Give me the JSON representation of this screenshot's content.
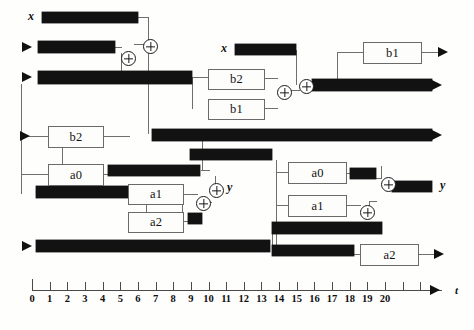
{
  "diagram": {
    "signal_labels": {
      "x_top_left": "x",
      "x_mid_top": "x",
      "y_mid_left": "y",
      "y_right": "y"
    },
    "operator_boxes": [
      {
        "id": "b2-left",
        "label": "b2",
        "x": 48,
        "y": 126,
        "w": 54,
        "h": 20
      },
      {
        "id": "a0-left",
        "label": "a0",
        "x": 48,
        "y": 164,
        "w": 54,
        "h": 20
      },
      {
        "id": "a1-mid",
        "label": "a1",
        "x": 128,
        "y": 184,
        "w": 54,
        "h": 19
      },
      {
        "id": "a2-mid",
        "label": "a2",
        "x": 128,
        "y": 212,
        "w": 54,
        "h": 19
      },
      {
        "id": "b2-mid",
        "label": "b2",
        "x": 208,
        "y": 69,
        "w": 55,
        "h": 19
      },
      {
        "id": "b1-mid",
        "label": "b1",
        "x": 208,
        "y": 99,
        "w": 55,
        "h": 19
      },
      {
        "id": "b1-top-right",
        "label": "b1",
        "x": 363,
        "y": 42,
        "w": 57,
        "h": 20
      },
      {
        "id": "a0-right",
        "label": "a0",
        "x": 288,
        "y": 162,
        "w": 57,
        "h": 20
      },
      {
        "id": "a1-right",
        "label": "a1",
        "x": 288,
        "y": 195,
        "w": 57,
        "h": 20
      },
      {
        "id": "a2-right",
        "label": "a2",
        "x": 360,
        "y": 244,
        "w": 57,
        "h": 20
      }
    ],
    "adders": [
      {
        "id": "add-1",
        "x": 121,
        "y": 51
      },
      {
        "id": "add-2",
        "x": 143,
        "y": 39
      },
      {
        "id": "add-3",
        "x": 277,
        "y": 85
      },
      {
        "id": "add-4",
        "x": 299,
        "y": 79
      },
      {
        "id": "add-5",
        "x": 209,
        "y": 183
      },
      {
        "id": "add-6",
        "x": 196,
        "y": 196
      },
      {
        "id": "add-7",
        "x": 381,
        "y": 177
      },
      {
        "id": "add-8",
        "x": 360,
        "y": 205
      }
    ],
    "bars": [
      {
        "id": "bar-x-top",
        "x": 42,
        "y": 12,
        "w": 96,
        "h": 11
      },
      {
        "id": "bar-row2",
        "x": 38,
        "y": 41,
        "w": 77,
        "h": 12
      },
      {
        "id": "bar-row3",
        "x": 38,
        "y": 71,
        "w": 154,
        "h": 13
      },
      {
        "id": "bar-x-mid",
        "x": 235,
        "y": 44,
        "w": 61,
        "h": 11
      },
      {
        "id": "bar-out-upper",
        "x": 312,
        "y": 79,
        "w": 120,
        "h": 12
      },
      {
        "id": "bar-long-mid",
        "x": 152,
        "y": 129,
        "w": 280,
        "h": 12
      },
      {
        "id": "bar-short-mid",
        "x": 190,
        "y": 149,
        "w": 82,
        "h": 11
      },
      {
        "id": "bar-a0-out-left",
        "x": 108,
        "y": 165,
        "w": 92,
        "h": 11
      },
      {
        "id": "bar-left-mid",
        "x": 36,
        "y": 186,
        "w": 110,
        "h": 12
      },
      {
        "id": "bar-a0-out-right",
        "x": 350,
        "y": 168,
        "w": 26,
        "h": 11
      },
      {
        "id": "bar-y-right",
        "x": 392,
        "y": 181,
        "w": 40,
        "h": 11
      },
      {
        "id": "bar-a2-feed",
        "x": 188,
        "y": 213,
        "w": 14,
        "h": 11
      },
      {
        "id": "bar-mid-lower",
        "x": 272,
        "y": 222,
        "w": 110,
        "h": 12
      },
      {
        "id": "bar-bottom-long",
        "x": 36,
        "y": 240,
        "w": 234,
        "h": 12
      },
      {
        "id": "bar-a2-in-right",
        "x": 272,
        "y": 245,
        "w": 82,
        "h": 11
      }
    ],
    "wires_h": [
      {
        "x": 138,
        "y": 17,
        "w": 10
      },
      {
        "x": 115,
        "y": 47,
        "w": 7
      },
      {
        "x": 134,
        "y": 44,
        "w": 10
      },
      {
        "x": 192,
        "y": 77,
        "w": 16
      },
      {
        "x": 263,
        "y": 78,
        "w": 15
      },
      {
        "x": 263,
        "y": 108,
        "w": 15
      },
      {
        "x": 290,
        "y": 90,
        "w": 10
      },
      {
        "x": 305,
        "y": 85,
        "w": 8
      },
      {
        "x": 337,
        "y": 52,
        "w": 26
      },
      {
        "x": 420,
        "y": 52,
        "w": 18
      },
      {
        "x": 21,
        "y": 136,
        "w": 27
      },
      {
        "x": 102,
        "y": 136,
        "w": 28
      },
      {
        "x": 21,
        "y": 174,
        "w": 27
      },
      {
        "x": 102,
        "y": 174,
        "w": 7
      },
      {
        "x": 146,
        "y": 192,
        "w": 26
      },
      {
        "x": 146,
        "y": 221,
        "w": 26
      },
      {
        "x": 182,
        "y": 194,
        "w": 16
      },
      {
        "x": 182,
        "y": 221,
        "w": 8
      },
      {
        "x": 206,
        "y": 202,
        "w": 6
      },
      {
        "x": 215,
        "y": 190,
        "w": 8
      },
      {
        "x": 201,
        "y": 170,
        "w": 9
      },
      {
        "x": 276,
        "y": 172,
        "w": 12
      },
      {
        "x": 276,
        "y": 205,
        "w": 12
      },
      {
        "x": 345,
        "y": 173,
        "w": 6
      },
      {
        "x": 345,
        "y": 205,
        "w": 16
      },
      {
        "x": 376,
        "y": 178,
        "w": 6
      },
      {
        "x": 369,
        "y": 201,
        "w": 8
      },
      {
        "x": 388,
        "y": 186,
        "w": 5
      },
      {
        "x": 354,
        "y": 254,
        "w": 7
      },
      {
        "x": 417,
        "y": 254,
        "w": 17
      }
    ],
    "wires_v": [
      {
        "x": 148,
        "y": 17,
        "h": 28
      },
      {
        "x": 121,
        "y": 53,
        "h": 20
      },
      {
        "x": 148,
        "y": 50,
        "h": 84
      },
      {
        "x": 296,
        "y": 50,
        "h": 35
      },
      {
        "x": 337,
        "y": 52,
        "h": 33
      },
      {
        "x": 192,
        "y": 77,
        "h": 32
      },
      {
        "x": 21,
        "y": 84,
        "h": 110
      },
      {
        "x": 62,
        "y": 146,
        "h": 50
      },
      {
        "x": 202,
        "y": 141,
        "h": 30
      },
      {
        "x": 146,
        "y": 192,
        "h": 30
      },
      {
        "x": 172,
        "y": 186,
        "h": 8
      },
      {
        "x": 182,
        "y": 194,
        "h": 27
      },
      {
        "x": 215,
        "y": 176,
        "h": 15
      },
      {
        "x": 276,
        "y": 160,
        "h": 90
      },
      {
        "x": 272,
        "y": 234,
        "h": 12
      },
      {
        "x": 381,
        "y": 166,
        "h": 12
      },
      {
        "x": 369,
        "y": 201,
        "h": 8
      }
    ],
    "output_arrows": [
      {
        "id": "arrow-b1-top-right",
        "x": 438,
        "y": 47
      },
      {
        "id": "arrow-out-upper",
        "x": 432,
        "y": 80
      },
      {
        "id": "arrow-long-mid",
        "x": 432,
        "y": 130
      },
      {
        "id": "arrow-a2-right",
        "x": 434,
        "y": 249
      }
    ],
    "input_arrows": [
      {
        "id": "arrow-in-row2",
        "x": 22,
        "y": 42
      },
      {
        "id": "arrow-in-row3",
        "x": 22,
        "y": 72
      },
      {
        "id": "arrow-in-b2",
        "x": 20,
        "y": 131
      },
      {
        "id": "arrow-in-bottom",
        "x": 22,
        "y": 241
      }
    ]
  },
  "axis": {
    "label": "t",
    "ticks": [
      "0",
      "1",
      "2",
      "3",
      "4",
      "5",
      "6",
      "7",
      "8",
      "9",
      "10",
      "11",
      "12",
      "13",
      "14",
      "15",
      "16",
      "17",
      "18",
      "19",
      "20"
    ],
    "extra_ticks": 2,
    "origin_x": 32,
    "spacing": 17.65,
    "baseline_y": 290
  }
}
